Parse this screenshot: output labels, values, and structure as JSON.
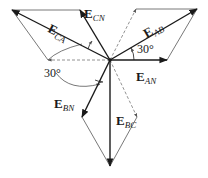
{
  "diagram": {
    "center": {
      "x": 110,
      "y": 60
    },
    "vectors": [
      {
        "id": "E_AB",
        "main": "E",
        "sub": "AB",
        "from": [
          110,
          60
        ],
        "to": [
          197,
          9
        ],
        "style": "solid",
        "weight": "heavy"
      },
      {
        "id": "E_AN",
        "main": "E",
        "sub": "AN",
        "from": [
          110,
          60
        ],
        "to": [
          167,
          60
        ],
        "style": "solid",
        "weight": "heavy"
      },
      {
        "id": "E_CN",
        "main": "E",
        "sub": "CN",
        "from": [
          110,
          60
        ],
        "to": [
          80,
          10
        ],
        "style": "solid",
        "weight": "heavy"
      },
      {
        "id": "E_CA",
        "main": "E",
        "sub": "CA",
        "from": [
          110,
          60
        ],
        "to": [
          12,
          10
        ],
        "style": "solid",
        "weight": "heavy"
      },
      {
        "id": "E_BN",
        "main": "E",
        "sub": "BN",
        "from": [
          110,
          60
        ],
        "to": [
          82,
          117
        ],
        "style": "solid",
        "weight": "heavy"
      },
      {
        "id": "E_BC",
        "main": "E",
        "sub": "BC",
        "from": [
          110,
          60
        ],
        "to": [
          110,
          166
        ],
        "style": "solid",
        "weight": "heavy"
      }
    ],
    "construction_lines": [
      {
        "from": [
          110,
          60
        ],
        "to": [
          136,
          9
        ],
        "style": "dashed",
        "arrow": true
      },
      {
        "from": [
          136,
          9
        ],
        "to": [
          197,
          9
        ],
        "style": "thin"
      },
      {
        "from": [
          167,
          60
        ],
        "to": [
          197,
          9
        ],
        "style": "thin"
      },
      {
        "from": [
          110,
          60
        ],
        "to": [
          48,
          60
        ],
        "style": "dashed",
        "arrow": true
      },
      {
        "from": [
          48,
          60
        ],
        "to": [
          12,
          10
        ],
        "style": "thin"
      },
      {
        "from": [
          80,
          10
        ],
        "to": [
          12,
          10
        ],
        "style": "thin"
      },
      {
        "from": [
          110,
          60
        ],
        "to": [
          137,
          117
        ],
        "style": "dashed",
        "arrow": true
      },
      {
        "from": [
          137,
          117
        ],
        "to": [
          110,
          166
        ],
        "style": "thin"
      },
      {
        "from": [
          82,
          117
        ],
        "to": [
          110,
          166
        ],
        "style": "thin"
      }
    ],
    "labels": [
      {
        "for": "E_CN",
        "main": "E",
        "sub": "CN",
        "x": 84,
        "y": 5
      },
      {
        "for": "E_CA",
        "main": "E",
        "sub": "CA",
        "x": 53,
        "y": 20,
        "rotate": 27
      },
      {
        "for": "E_AB",
        "main": "E",
        "sub": "AB",
        "x": 140,
        "y": 20,
        "rotate": -30
      },
      {
        "for": "E_AN",
        "main": "E",
        "sub": "AN",
        "x": 136,
        "y": 68
      },
      {
        "for": "E_BN",
        "main": "E",
        "sub": "BN",
        "x": 54,
        "y": 95
      },
      {
        "for": "E_BC",
        "main": "E",
        "sub": "BC",
        "x": 116,
        "y": 112
      }
    ],
    "angles": [
      {
        "text": "30°",
        "x": 137,
        "y": 43,
        "arc_center": [
          110,
          60
        ],
        "arc_radius": 24,
        "from_deg": 0,
        "to_deg": 30
      },
      {
        "text": "30°",
        "x": 44,
        "y": 67,
        "arc": "large sweep from left-dashed reference toward E_BN"
      }
    ],
    "colors": {
      "heavy": "#1a1a1a",
      "thin": "#555555",
      "dashed": "#777777",
      "background": "#ffffff"
    }
  }
}
